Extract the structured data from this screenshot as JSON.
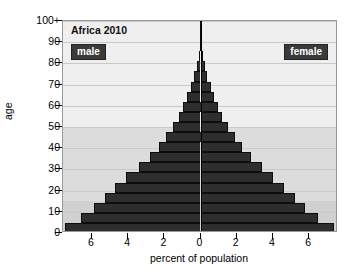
{
  "chart_data": {
    "type": "bar",
    "subtype": "population-pyramid",
    "title": "Africa 2010",
    "xlabel": "percent of population",
    "ylabel": "age",
    "xtick_labels": [
      "6",
      "4",
      "2",
      "0",
      "2",
      "4",
      "6"
    ],
    "xtick_values": [
      -6,
      -4,
      -2,
      0,
      2,
      4,
      6
    ],
    "xlim": [
      -7.6,
      7.6
    ],
    "ytick_labels": [
      "0",
      "10",
      "20",
      "30",
      "40",
      "50",
      "60",
      "70",
      "80",
      "90",
      "100+"
    ],
    "ytick_values": [
      0,
      10,
      20,
      30,
      40,
      50,
      60,
      70,
      80,
      90,
      100
    ],
    "ylim": [
      0,
      100
    ],
    "grid": true,
    "legend": [
      "male",
      "female"
    ],
    "legend_position": "inside-top-left-and-top-right",
    "bar_color": "#2e2e2e",
    "plot_background": "#f2f2f2",
    "categories": [
      "0-4",
      "5-9",
      "10-14",
      "15-19",
      "20-24",
      "25-29",
      "30-34",
      "35-39",
      "40-44",
      "45-49",
      "50-54",
      "55-59",
      "60-64",
      "65-69",
      "70-74",
      "75-79",
      "80-84",
      "85-89",
      "90-94",
      "95-99",
      "100+"
    ],
    "series": [
      {
        "name": "male",
        "side": "left",
        "values": [
          7.5,
          6.6,
          5.9,
          5.3,
          4.7,
          4.1,
          3.4,
          2.8,
          2.3,
          1.9,
          1.5,
          1.2,
          0.95,
          0.72,
          0.52,
          0.34,
          0.2,
          0.1,
          0.05,
          0.02,
          0.01
        ]
      },
      {
        "name": "female",
        "side": "right",
        "values": [
          7.4,
          6.5,
          5.8,
          5.2,
          4.6,
          4.0,
          3.4,
          2.8,
          2.3,
          1.9,
          1.5,
          1.2,
          0.98,
          0.76,
          0.56,
          0.38,
          0.23,
          0.12,
          0.06,
          0.02,
          0.01
        ]
      }
    ],
    "background_bands": [
      {
        "from_age": 0,
        "to_age": 15,
        "color": "#d0d0d0"
      },
      {
        "from_age": 15,
        "to_age": 50,
        "color": "#dcdcdc"
      },
      {
        "from_age": 50,
        "to_age": 100,
        "color": "#efefef"
      }
    ]
  }
}
